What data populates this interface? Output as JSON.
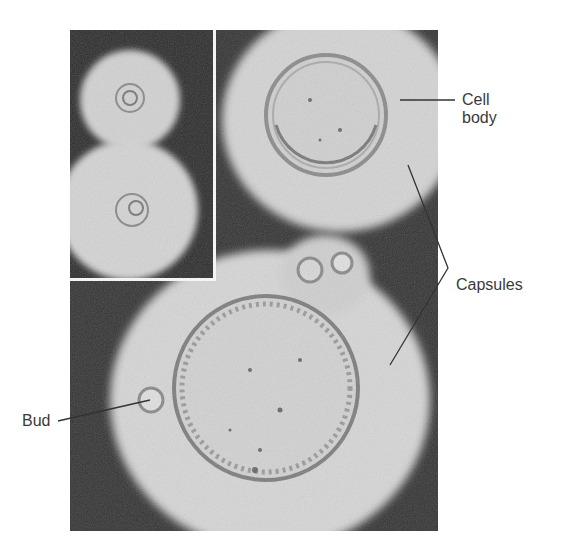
{
  "figure": {
    "labels": {
      "cell_body": "Cell\nbody",
      "cell_body_line1": "Cell",
      "cell_body_line2": "body",
      "capsules": "Capsules",
      "bud": "Bud"
    },
    "colors": {
      "background": "#2f2f2f",
      "capsule": "#d6d6d6",
      "cell_wall": "#8a8a8a",
      "label_text": "#3a3a3a",
      "leader_line": "#333333",
      "inset_border": "#f4f4f4"
    }
  }
}
